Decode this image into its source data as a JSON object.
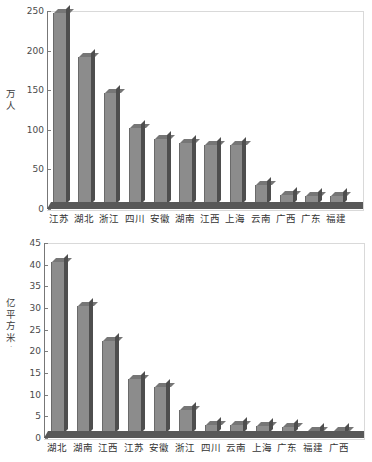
{
  "chart_data": [
    {
      "id": "top",
      "type": "bar",
      "title": "",
      "xlabel": "",
      "ylabel": "万人",
      "ylabel_chars": [
        "万",
        "人"
      ],
      "ylim": [
        0,
        250
      ],
      "yticks": [
        0,
        50,
        100,
        150,
        200,
        250
      ],
      "ytick_labels": [
        "0",
        "50",
        "100",
        "150",
        "200",
        "250"
      ],
      "grid": false,
      "legend": "none",
      "categories": [
        "江苏",
        "湖北",
        "浙江",
        "四川",
        "安徽",
        "湖南",
        "江西",
        "上海",
        "云南",
        "广西",
        "广东",
        "福建"
      ],
      "values": [
        250,
        192,
        145,
        99,
        85,
        80,
        77,
        77,
        25,
        12,
        10,
        10
      ]
    },
    {
      "id": "bottom",
      "type": "bar",
      "title": "",
      "xlabel": "",
      "ylabel": "亿平方米",
      "ylabel_chars": [
        "亿",
        "平",
        "方",
        "米"
      ],
      "ylabel_suffix": "·",
      "ylim": [
        0,
        45
      ],
      "yticks": [
        0,
        5,
        10,
        15,
        20,
        25,
        30,
        35,
        40,
        45
      ],
      "ytick_labels": [
        "0",
        "5",
        "10",
        "15",
        "20",
        "25",
        "30",
        "35",
        "40",
        "45"
      ],
      "grid": false,
      "legend": "none",
      "categories": [
        "湖北",
        "湖南",
        "江西",
        "江苏",
        "安徽",
        "浙江",
        "四川",
        "云南",
        "上海",
        "广东",
        "福建",
        "广西"
      ],
      "values": [
        41,
        30.5,
        22,
        13,
        11,
        5.5,
        2.0,
        1.8,
        1.7,
        1.5,
        0.3,
        0.3
      ]
    }
  ],
  "colors": {
    "bar_face": "#8c8c8c",
    "bar_side": "#4e4e4e",
    "bar_top": "#767676",
    "floor": "#585858",
    "axis": "#777777",
    "frame": "#d9d9d9",
    "text": "#333333",
    "background": "#ffffff"
  }
}
